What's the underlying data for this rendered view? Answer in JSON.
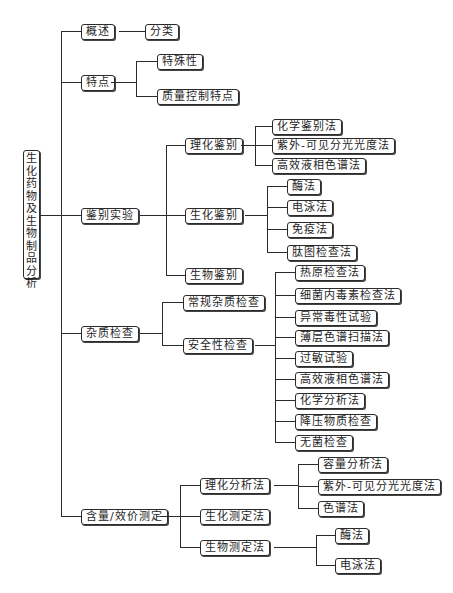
{
  "diagram": {
    "type": "tree-mindmap",
    "root": {
      "label": "生化药物及生物制品分析"
    },
    "nodes": {
      "overview": "概述",
      "classification": "分类",
      "features": "特点",
      "specificity": "特殊性",
      "quality_control_features": "质量控制特点",
      "identification": "鉴别实验",
      "physchem_identification": "理化鉴别",
      "chemical_identification": "化学鉴别法",
      "uv_vis_1": "紫外-可见分光光度法",
      "hplc_1": "高效液相色谱法",
      "biochem_identification": "生化鉴别",
      "enzyme_1": "酶法",
      "electrophoresis_1": "电泳法",
      "immunoassay": "免疫法",
      "peptide_mapping": "肽图检查法",
      "bio_identification": "生物鉴别",
      "impurity_test": "杂质检查",
      "routine_impurity": "常规杂质检查",
      "safety_test": "安全性检查",
      "pyrogen": "热原检查法",
      "endotoxin": "细菌内毒素检查法",
      "abnormal_toxicity": "异常毒性试验",
      "tlc_scan": "薄层色谱扫描法",
      "allergy": "过敏试验",
      "hplc_2": "高效液相色谱法",
      "chemical_analysis": "化学分析法",
      "depressor": "降压物质检查",
      "sterility": "无菌检查",
      "assay": "含量/效价测定",
      "physchem_analysis": "理化分析法",
      "volumetric": "容量分析法",
      "uv_vis_2": "紫外-可见分光光度法",
      "chromatography": "色谱法",
      "biochem_assay": "生化测定法",
      "bio_assay": "生物测定法",
      "enzyme_2": "酶法",
      "electrophoresis_2": "电泳法"
    },
    "edges": [
      [
        "root",
        "overview"
      ],
      [
        "root",
        "features"
      ],
      [
        "root",
        "identification"
      ],
      [
        "root",
        "impurity_test"
      ],
      [
        "root",
        "assay"
      ],
      [
        "overview",
        "classification"
      ],
      [
        "features",
        "specificity"
      ],
      [
        "features",
        "quality_control_features"
      ],
      [
        "identification",
        "physchem_identification"
      ],
      [
        "identification",
        "biochem_identification"
      ],
      [
        "identification",
        "bio_identification"
      ],
      [
        "physchem_identification",
        "chemical_identification"
      ],
      [
        "physchem_identification",
        "uv_vis_1"
      ],
      [
        "physchem_identification",
        "hplc_1"
      ],
      [
        "biochem_identification",
        "enzyme_1"
      ],
      [
        "biochem_identification",
        "electrophoresis_1"
      ],
      [
        "biochem_identification",
        "immunoassay"
      ],
      [
        "biochem_identification",
        "peptide_mapping"
      ],
      [
        "impurity_test",
        "routine_impurity"
      ],
      [
        "impurity_test",
        "safety_test"
      ],
      [
        "safety_test",
        "pyrogen"
      ],
      [
        "safety_test",
        "endotoxin"
      ],
      [
        "safety_test",
        "abnormal_toxicity"
      ],
      [
        "safety_test",
        "tlc_scan"
      ],
      [
        "safety_test",
        "allergy"
      ],
      [
        "safety_test",
        "hplc_2"
      ],
      [
        "safety_test",
        "chemical_analysis"
      ],
      [
        "safety_test",
        "depressor"
      ],
      [
        "safety_test",
        "sterility"
      ],
      [
        "assay",
        "physchem_analysis"
      ],
      [
        "assay",
        "biochem_assay"
      ],
      [
        "assay",
        "bio_assay"
      ],
      [
        "physchem_analysis",
        "volumetric"
      ],
      [
        "physchem_analysis",
        "uv_vis_2"
      ],
      [
        "physchem_analysis",
        "chromatography"
      ],
      [
        "bio_assay",
        "enzyme_2"
      ],
      [
        "bio_assay",
        "electrophoresis_2"
      ]
    ],
    "colors": {
      "line": "#2b2b2b",
      "box_border": "#2b2b2b",
      "text": "#1e1e1e",
      "background": "#ffffff"
    }
  }
}
